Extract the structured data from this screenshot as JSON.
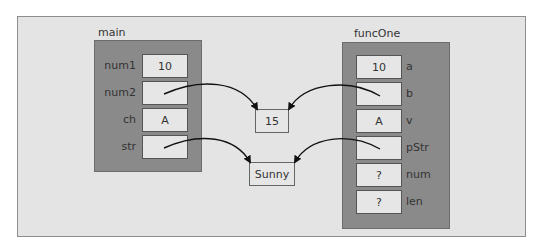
{
  "frames": {
    "main": {
      "label": "main",
      "vars": [
        {
          "name": "num1",
          "value": "10"
        },
        {
          "name": "num2",
          "value": ""
        },
        {
          "name": "ch",
          "value": "A"
        },
        {
          "name": "str",
          "value": ""
        }
      ]
    },
    "funcOne": {
      "label": "funcOne",
      "vars": [
        {
          "name": "a",
          "value": "10"
        },
        {
          "name": "b",
          "value": ""
        },
        {
          "name": "v",
          "value": "A"
        },
        {
          "name": "pStr",
          "value": ""
        },
        {
          "name": "num",
          "value": "?"
        },
        {
          "name": "len",
          "value": "?"
        }
      ]
    }
  },
  "heap": {
    "int_value": "15",
    "string_value": "Sunny"
  },
  "pointers": [
    {
      "from": "main.num2",
      "to": "heap.int_value"
    },
    {
      "from": "main.str",
      "to": "heap.string_value"
    },
    {
      "from": "funcOne.b",
      "to": "heap.int_value"
    },
    {
      "from": "funcOne.pStr",
      "to": "heap.string_value"
    }
  ]
}
